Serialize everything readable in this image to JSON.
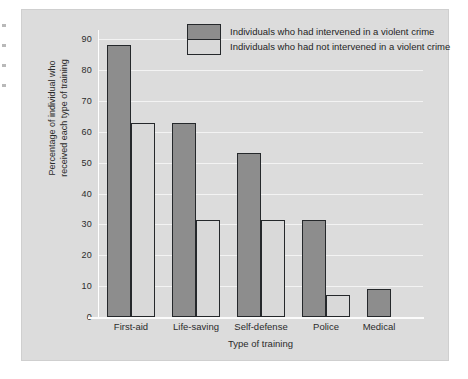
{
  "chart_data": {
    "type": "bar",
    "title": "",
    "xlabel": "Type of training",
    "ylabel_lines": [
      "Percentage of individual who",
      "received each type of training"
    ],
    "ylabel": "Percentage of individual who received each type of training",
    "categories": [
      "First-aid",
      "Life-saving",
      "Self-defense",
      "Police",
      "Medical"
    ],
    "series": [
      {
        "name": "Individuals who had intervened in a violent crime",
        "color": "#8d8d8d",
        "values": [
          88,
          63,
          53,
          31.5,
          9
        ]
      },
      {
        "name": "Individuals who had not intervened in a violent crime",
        "color": "#d9d9d9",
        "values": [
          63,
          31.5,
          31.5,
          7,
          null
        ]
      }
    ],
    "ylim": [
      0,
      93
    ],
    "yticks": [
      0,
      10,
      20,
      30,
      40,
      50,
      60,
      70,
      80,
      90
    ],
    "ytick_labels": [
      "0",
      "10",
      "20",
      "30",
      "40",
      "50",
      "60",
      "70",
      "80",
      "90"
    ],
    "grid": true,
    "legend_position": "top-center",
    "background_color": "#dcdcdc",
    "gridline_color": "#f3f3f3",
    "axis_color": "#ffffff",
    "bar_edge_color": "#25282b"
  },
  "legend": {
    "entries": [
      {
        "label": "Individuals who had intervened in a violent crime",
        "swatch": "dark"
      },
      {
        "label": "Individuals who had not intervened in a violent crime",
        "swatch": "light"
      }
    ]
  }
}
